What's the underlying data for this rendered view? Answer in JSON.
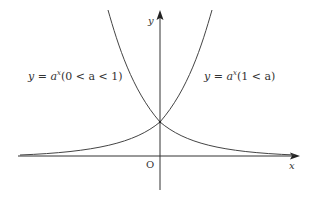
{
  "diagram": {
    "type": "function-graph",
    "axes": {
      "x_label": "x",
      "y_label": "y",
      "origin_label": "O"
    },
    "curves": [
      {
        "id": "decay",
        "label_prefix": "y = a",
        "label_exponent": "x",
        "label_condition": "(0 < a < 1)"
      },
      {
        "id": "growth",
        "label_prefix": "y = a",
        "label_exponent": "x",
        "label_condition": "(1 < a)"
      }
    ],
    "intersection": "(0, 1)",
    "colors": {
      "axis": "#333333",
      "curve": "#444444",
      "text": "#333333"
    }
  }
}
